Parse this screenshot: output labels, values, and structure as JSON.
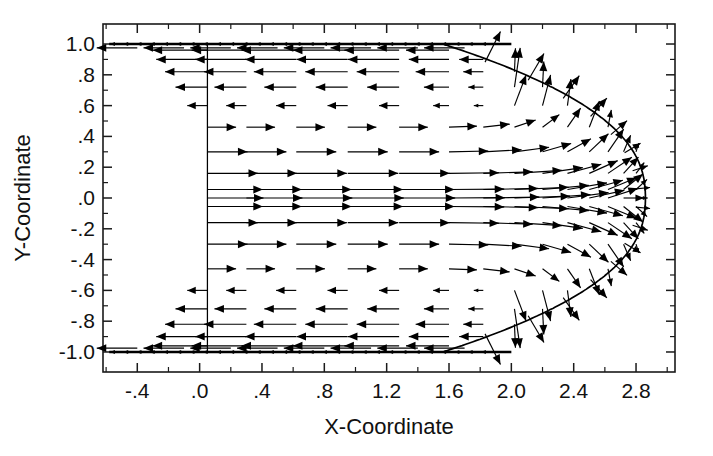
{
  "figure": {
    "kind": "vector-field-quiver-plot",
    "background_color": "#ffffff",
    "ink_color": "#000000",
    "width": 713,
    "height": 456
  },
  "chart_data": {
    "type": "scatter",
    "subtype": "quiver",
    "title": "",
    "xlabel": "X-Coordinate",
    "ylabel": "Y-Coordinate",
    "xlim": [
      -0.62,
      3.05
    ],
    "ylim": [
      -1.13,
      1.13
    ],
    "grid": false,
    "legend": null,
    "xticks": [
      -0.4,
      0.0,
      0.4,
      0.8,
      1.2,
      1.6,
      2.0,
      2.4,
      2.8
    ],
    "xticklabels": [
      "-.4",
      ".0",
      ".4",
      ".8",
      "1.2",
      "1.6",
      "2.0",
      "2.4",
      "2.8"
    ],
    "xtick_minor_step": 0.2,
    "yticks": [
      1.0,
      0.8,
      0.6,
      0.4,
      0.2,
      0.0,
      -0.2,
      -0.4,
      -0.6,
      -0.8,
      -1.0
    ],
    "yticklabels": [
      "1.0",
      ".8",
      ".6",
      ".4",
      ".2",
      ".0",
      "-.2",
      "-.4",
      "-.6",
      "-.8",
      "-1.0"
    ],
    "ytick_minor_step": 0.1,
    "annotations": [
      {
        "name": "inlet-boundary-line",
        "type": "vline",
        "x": 0.05,
        "y0": -1.0,
        "y1": 1.0
      },
      {
        "name": "free-surface-curve",
        "type": "curve",
        "description": "rounded front boundary from upper wall arcing to stagnation nose at x=2.85, mirrored below axis"
      },
      {
        "name": "top-wall",
        "type": "hline",
        "y": 1.0
      },
      {
        "name": "bottom-wall",
        "type": "hline",
        "y": -1.0
      }
    ],
    "arrow_grid": {
      "x_columns": [
        0.05,
        0.3,
        0.62,
        0.95,
        1.28,
        1.6,
        1.82,
        2.02,
        2.2,
        2.36,
        2.5,
        2.62,
        2.72,
        2.8
      ],
      "y_rows": [
        0.96,
        0.9,
        0.82,
        0.72,
        0.6,
        0.46,
        0.3,
        0.16,
        0.055,
        0.0,
        -0.055,
        -0.16,
        -0.3,
        -0.46,
        -0.6,
        -0.72,
        -0.82,
        -0.9,
        -0.96
      ],
      "symmetry": "mirror about y=0"
    },
    "flow_description": {
      "core_jet": "strong rightward vectors concentrated near y=0 between x=0.05 and x=2.6",
      "recirculation": "reverse (leftward) vectors along the upper and lower walls for |y|>0.55",
      "turning_region": "vectors rotate outward/upward along the curved front boundary toward the walls",
      "stagnation_nose": "x = 2.85, y = 0"
    },
    "points": [
      {
        "x": 0.05,
        "y": 0.96,
        "u": -0.26,
        "v": 0.0
      },
      {
        "x": 0.05,
        "y": 0.9,
        "u": -0.22,
        "v": 0.0
      },
      {
        "x": 0.05,
        "y": 0.82,
        "u": -0.17,
        "v": 0.0
      },
      {
        "x": 0.05,
        "y": 0.72,
        "u": 0.07,
        "v": 0.0
      },
      {
        "x": 0.05,
        "y": 0.6,
        "u": 0.03,
        "v": 0.0
      },
      {
        "x": 0.05,
        "y": 0.46,
        "u": 0.14,
        "v": 0.0
      },
      {
        "x": 0.05,
        "y": 0.3,
        "u": 0.16,
        "v": 0.0
      },
      {
        "x": 0.05,
        "y": 0.16,
        "u": 0.22,
        "v": 0.0
      },
      {
        "x": 0.05,
        "y": 0.055,
        "u": 0.29,
        "v": 0.0
      },
      {
        "x": 0.05,
        "y": 0.0,
        "u": 0.3,
        "v": 0.0
      },
      {
        "x": 0.05,
        "y": -0.055,
        "u": 0.29,
        "v": 0.0
      },
      {
        "x": 0.05,
        "y": -0.16,
        "u": 0.22,
        "v": 0.0
      },
      {
        "x": 0.05,
        "y": -0.3,
        "u": 0.16,
        "v": 0.0
      },
      {
        "x": 0.05,
        "y": -0.46,
        "u": 0.14,
        "v": 0.0
      },
      {
        "x": 0.05,
        "y": -0.6,
        "u": 0.03,
        "v": 0.0
      },
      {
        "x": 0.05,
        "y": -0.72,
        "u": 0.07,
        "v": 0.0
      },
      {
        "x": 0.05,
        "y": -0.82,
        "u": -0.17,
        "v": 0.0
      },
      {
        "x": 0.05,
        "y": -0.9,
        "u": -0.22,
        "v": 0.0
      },
      {
        "x": 0.05,
        "y": -0.96,
        "u": -0.26,
        "v": 0.0
      }
    ]
  },
  "axes": {
    "x_label": "X-Coordinate",
    "y_label": "Y-Coordinate"
  }
}
